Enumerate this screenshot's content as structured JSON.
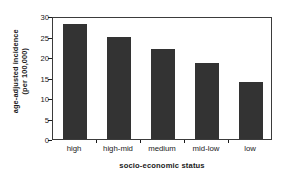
{
  "chart_data": {
    "type": "bar",
    "title": "",
    "subtitle": "",
    "categories": [
      "high",
      "high-mid",
      "medium",
      "mid-low",
      "low"
    ],
    "values": [
      28,
      25,
      22,
      18.5,
      14
    ],
    "series": [
      {
        "name": "age-adjusted incidence (per 100,000)",
        "values": [
          28,
          25,
          22,
          18.5,
          14
        ]
      }
    ],
    "xlabel": "socio-economic status",
    "ylabel_line1": "age-adjusted incidence",
    "ylabel_line2": "(per 100,000)",
    "ylabel": "age-adjusted incidence (per 100,000)",
    "ylim": [
      0,
      30
    ],
    "ytick_labels": [
      "0",
      "5",
      "10",
      "15",
      "20",
      "25",
      "30"
    ],
    "ytick_values": [
      0,
      5,
      10,
      15,
      20,
      25,
      30
    ],
    "grid": false,
    "legend": false,
    "legend_position": "none",
    "bar_color": "#333333",
    "frame_color": "#3b3b3b",
    "background_color": "#ffffff",
    "text_color": "#1a1a1a"
  }
}
